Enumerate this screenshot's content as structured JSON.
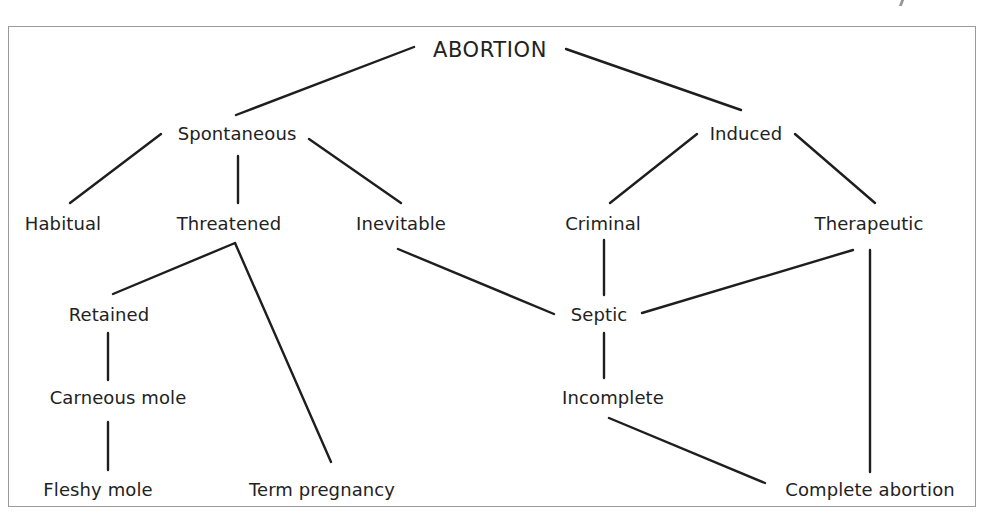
{
  "diagram": {
    "type": "classification-tree",
    "root": "ABORTION",
    "nodes": {
      "abortion": "ABORTION",
      "spontaneous": "Spontaneous",
      "induced": "Induced",
      "habitual": "Habitual",
      "threatened": "Threatened",
      "inevitable": "Inevitable",
      "criminal": "Criminal",
      "therapeutic": "Therapeutic",
      "retained": "Retained",
      "septic": "Septic",
      "carneous_mole": "Carneous mole",
      "incomplete": "Incomplete",
      "fleshy_mole": "Fleshy mole",
      "term_pregnancy": "Term pregnancy",
      "complete_abortion": "Complete abortion"
    },
    "edges": [
      [
        "ABORTION",
        "Spontaneous"
      ],
      [
        "ABORTION",
        "Induced"
      ],
      [
        "Spontaneous",
        "Habitual"
      ],
      [
        "Spontaneous",
        "Threatened"
      ],
      [
        "Spontaneous",
        "Inevitable"
      ],
      [
        "Induced",
        "Criminal"
      ],
      [
        "Induced",
        "Therapeutic"
      ],
      [
        "Threatened",
        "Retained"
      ],
      [
        "Threatened",
        "Term pregnancy"
      ],
      [
        "Inevitable",
        "Septic"
      ],
      [
        "Criminal",
        "Septic"
      ],
      [
        "Therapeutic",
        "Septic"
      ],
      [
        "Therapeutic",
        "Complete abortion"
      ],
      [
        "Retained",
        "Carneous mole"
      ],
      [
        "Carneous mole",
        "Fleshy mole"
      ],
      [
        "Septic",
        "Incomplete"
      ],
      [
        "Incomplete",
        "Complete abortion"
      ]
    ]
  },
  "colors": {
    "line": "#1e1e1e",
    "text": "#222222",
    "frame": "#9a9a9a",
    "background": "#ffffff"
  }
}
